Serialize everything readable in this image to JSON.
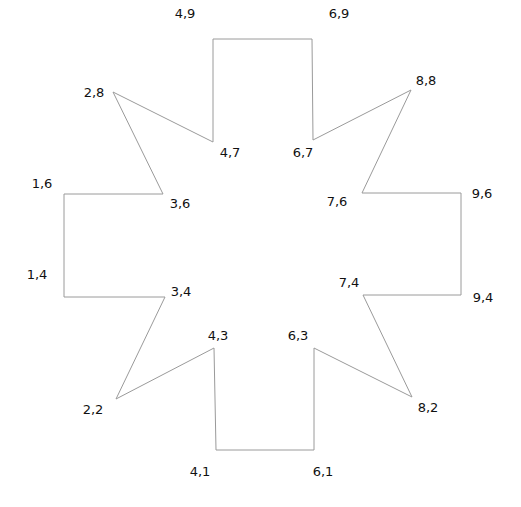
{
  "diagram": {
    "type": "polygon",
    "stroke_color": "#9a9a9a",
    "label_color": "#111111",
    "background": "#ffffff",
    "vertices": [
      {
        "label": "4,9",
        "x": 4,
        "y": 9,
        "px": 213,
        "py": 39,
        "lx": 185,
        "ly": 13
      },
      {
        "label": "6,9",
        "x": 6,
        "y": 9,
        "px": 312,
        "py": 39,
        "lx": 339,
        "ly": 13
      },
      {
        "label": "6,7",
        "x": 6,
        "y": 7,
        "px": 313,
        "py": 140,
        "lx": 303,
        "ly": 152
      },
      {
        "label": "8,8",
        "x": 8,
        "y": 8,
        "px": 411,
        "py": 90,
        "lx": 426,
        "ly": 80
      },
      {
        "label": "7,6",
        "x": 7,
        "y": 6,
        "px": 362,
        "py": 193,
        "lx": 337,
        "ly": 201
      },
      {
        "label": "9,6",
        "x": 9,
        "y": 6,
        "px": 461,
        "py": 193,
        "lx": 482,
        "ly": 193
      },
      {
        "label": "9,4",
        "x": 9,
        "y": 4,
        "px": 461,
        "py": 295,
        "lx": 483,
        "ly": 297
      },
      {
        "label": "7,4",
        "x": 7,
        "y": 4,
        "px": 363,
        "py": 295,
        "lx": 349,
        "ly": 282
      },
      {
        "label": "8,2",
        "x": 8,
        "y": 2,
        "px": 412,
        "py": 397,
        "lx": 428,
        "ly": 407
      },
      {
        "label": "6,3",
        "x": 6,
        "y": 3,
        "px": 314,
        "py": 348,
        "lx": 298,
        "ly": 335
      },
      {
        "label": "6,1",
        "x": 6,
        "y": 1,
        "px": 314,
        "py": 450,
        "lx": 323,
        "ly": 471
      },
      {
        "label": "4,1",
        "x": 4,
        "y": 1,
        "px": 216,
        "py": 450,
        "lx": 200,
        "ly": 471
      },
      {
        "label": "4,3",
        "x": 4,
        "y": 3,
        "px": 214,
        "py": 348,
        "lx": 218,
        "ly": 335
      },
      {
        "label": "2,2",
        "x": 2,
        "y": 2,
        "px": 116,
        "py": 399,
        "lx": 93,
        "ly": 409
      },
      {
        "label": "3,4",
        "x": 3,
        "y": 4,
        "px": 165,
        "py": 297,
        "lx": 181,
        "ly": 291
      },
      {
        "label": "1,4",
        "x": 1,
        "y": 4,
        "px": 64,
        "py": 297,
        "lx": 37,
        "ly": 274
      },
      {
        "label": "1,6",
        "x": 1,
        "y": 6,
        "px": 64,
        "py": 194,
        "lx": 42,
        "ly": 183
      },
      {
        "label": "3,6",
        "x": 3,
        "y": 6,
        "px": 163,
        "py": 194,
        "lx": 180,
        "ly": 203
      },
      {
        "label": "2,8",
        "x": 2,
        "y": 8,
        "px": 113,
        "py": 92,
        "lx": 94,
        "ly": 92
      },
      {
        "label": "4,7",
        "x": 4,
        "y": 7,
        "px": 213,
        "py": 142,
        "lx": 230,
        "ly": 152
      }
    ]
  }
}
